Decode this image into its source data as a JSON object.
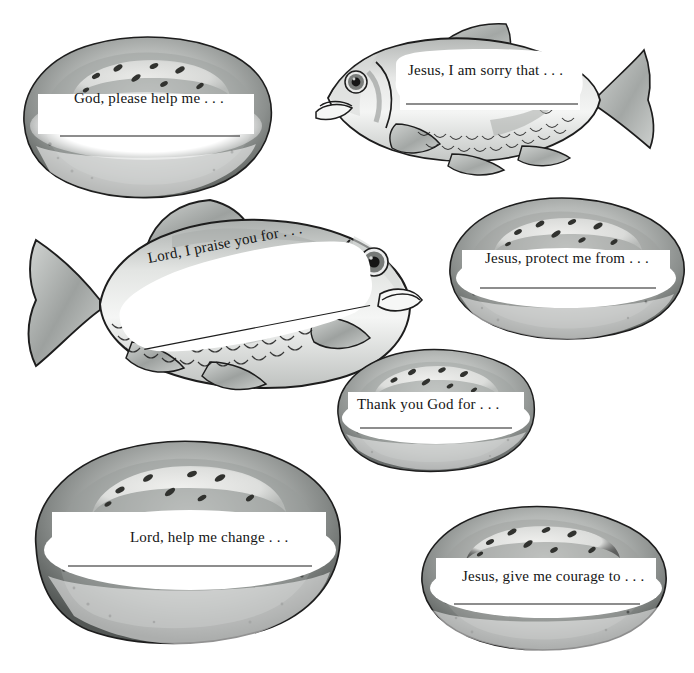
{
  "page": {
    "background_color": "#ffffff",
    "width": 694,
    "height": 673,
    "text_color": "#141414"
  },
  "palette": {
    "outline": "#1d1d1d",
    "crust_light": "#cfd1cf",
    "crust_mid": "#a8aaa8",
    "crust_dark": "#6e7270",
    "crust_shadow": "#4a4d4c",
    "crumb": "#f6f6f4",
    "seed_dark": "#31322f",
    "fish_body_light": "#f2f3f2",
    "fish_body_mid": "#b9bcba",
    "fish_fin": "#9fa3a1",
    "fish_eye_ring": "#6c6e6c",
    "fish_pupil": "#141414",
    "write_line": "#1d1d1d",
    "white_panel": "#ffffff"
  },
  "items": [
    {
      "id": "bread-top-left",
      "kind": "bread",
      "name": "bread-loaf-god-please-help-me",
      "prompt": "God, please help me . . .",
      "seed_count": 8,
      "has_write_line": true
    },
    {
      "id": "fish-top-right",
      "kind": "fish",
      "name": "fish-jesus-i-am-sorry-that",
      "prompt": "Jesus, I am sorry that . . .",
      "facing": "left",
      "has_write_line": true
    },
    {
      "id": "fish-middle-left",
      "kind": "fish",
      "name": "fish-lord-i-praise-you-for",
      "prompt": "Lord, I praise you for . . .",
      "facing": "right",
      "has_write_line": true
    },
    {
      "id": "bread-middle-right",
      "kind": "bread",
      "name": "bread-loaf-jesus-protect-me-from",
      "prompt": "Jesus, protect me from . . .",
      "seed_count": 8,
      "has_write_line": true
    },
    {
      "id": "bread-center",
      "kind": "bread",
      "name": "bread-loaf-thank-you-god-for",
      "prompt": "Thank you God for . . .",
      "seed_count": 7,
      "has_write_line": true
    },
    {
      "id": "bread-bottom-left",
      "kind": "bread",
      "name": "bread-loaf-lord-help-me-change",
      "prompt": "Lord, help me change . . .",
      "seed_count": 8,
      "has_write_line": true
    },
    {
      "id": "bread-bottom-right",
      "kind": "bread",
      "name": "bread-loaf-jesus-give-me-courage-to",
      "prompt": "Jesus, give me courage to . . .",
      "seed_count": 8,
      "has_write_line": true
    }
  ]
}
